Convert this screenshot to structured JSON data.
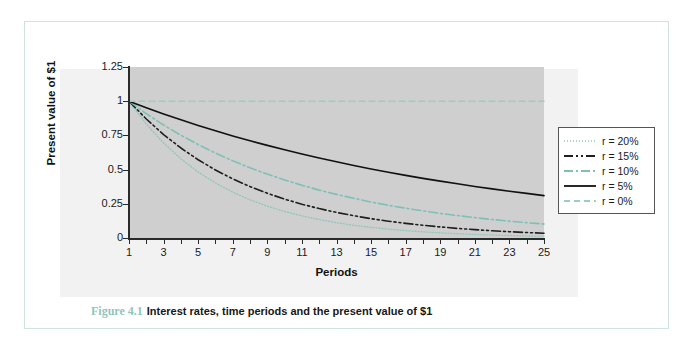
{
  "figure": {
    "caption_number": "Figure 4.1",
    "caption_text": "Interest rates, time periods and the present value of $1",
    "border_color": "#cfe3de",
    "accent_color": "#8fc6bc",
    "plot_bg_color": "#cfcfcf"
  },
  "chart_data": {
    "type": "line",
    "title": "Interest rates, time periods and the present value of $1",
    "xlabel": "Periods",
    "ylabel": "Present value of $1",
    "xlim": [
      1,
      25
    ],
    "ylim": [
      0,
      1.25
    ],
    "grid": false,
    "legend_position": "right",
    "x_tick_labels": [
      "1",
      "3",
      "5",
      "7",
      "9",
      "11",
      "13",
      "15",
      "17",
      "19",
      "21",
      "23",
      "25"
    ],
    "y_tick_labels": [
      "0",
      "0.25",
      "0.5",
      "0.75",
      "1",
      "1.25"
    ],
    "y_ticks": [
      0,
      0.25,
      0.5,
      0.75,
      1,
      1.25
    ],
    "x": [
      1,
      2,
      3,
      4,
      5,
      6,
      7,
      8,
      9,
      10,
      11,
      12,
      13,
      14,
      15,
      16,
      17,
      18,
      19,
      20,
      21,
      22,
      23,
      24,
      25
    ],
    "series": [
      {
        "name": "r = 20%",
        "rate": 0.2,
        "color": "#8fc6bc",
        "style": "dotted",
        "values": [
          1,
          0.833,
          0.694,
          0.579,
          0.482,
          0.402,
          0.335,
          0.279,
          0.233,
          0.194,
          0.162,
          0.135,
          0.112,
          0.093,
          0.078,
          0.065,
          0.054,
          0.045,
          0.038,
          0.031,
          0.026,
          0.022,
          0.018,
          0.015,
          0.013
        ]
      },
      {
        "name": "r = 15%",
        "rate": 0.15,
        "color": "#1f1f1f",
        "style": "dash-dot-dot",
        "values": [
          1,
          0.87,
          0.756,
          0.658,
          0.572,
          0.497,
          0.432,
          0.376,
          0.327,
          0.284,
          0.247,
          0.215,
          0.187,
          0.163,
          0.141,
          0.123,
          0.107,
          0.093,
          0.081,
          0.07,
          0.061,
          0.053,
          0.046,
          0.04,
          0.035
        ]
      },
      {
        "name": "r = 10%",
        "rate": 0.1,
        "color": "#7ec0b4",
        "style": "dash-dot",
        "values": [
          1,
          0.909,
          0.826,
          0.751,
          0.683,
          0.621,
          0.564,
          0.513,
          0.467,
          0.424,
          0.386,
          0.35,
          0.319,
          0.29,
          0.263,
          0.239,
          0.218,
          0.198,
          0.18,
          0.164,
          0.149,
          0.135,
          0.123,
          0.112,
          0.102
        ]
      },
      {
        "name": "r = 5%",
        "rate": 0.05,
        "color": "#111111",
        "style": "solid",
        "values": [
          1,
          0.952,
          0.907,
          0.864,
          0.823,
          0.784,
          0.746,
          0.711,
          0.677,
          0.645,
          0.614,
          0.585,
          0.557,
          0.53,
          0.505,
          0.481,
          0.458,
          0.436,
          0.416,
          0.396,
          0.377,
          0.359,
          0.342,
          0.326,
          0.31
        ]
      },
      {
        "name": "r = 0%",
        "rate": 0.0,
        "color": "#9ccdc3",
        "style": "dashed",
        "values": [
          1,
          1,
          1,
          1,
          1,
          1,
          1,
          1,
          1,
          1,
          1,
          1,
          1,
          1,
          1,
          1,
          1,
          1,
          1,
          1,
          1,
          1,
          1,
          1,
          1
        ]
      }
    ]
  }
}
